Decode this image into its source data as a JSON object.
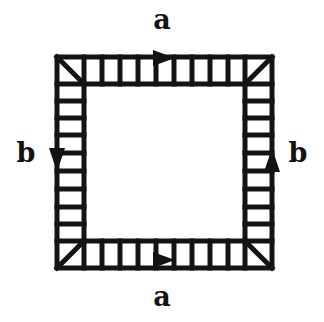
{
  "figure": {
    "ink_color": "#141414",
    "background_color": "#ffffff",
    "interior_color": "#ffffff",
    "geometry": {
      "outer_left": 57,
      "outer_top": 57,
      "outer_right": 272,
      "outer_bottom": 268,
      "band_thickness": 27,
      "stroke_width": 5,
      "cells_per_edge": 9,
      "corner_diagonals": 4
    },
    "edges": [
      {
        "id": "top",
        "label": "a",
        "arrow_direction": "right",
        "arrow_glyph": "▶",
        "arrow_count": 1,
        "label_position": "above"
      },
      {
        "id": "bottom",
        "label": "a",
        "arrow_direction": "right",
        "arrow_glyph": "▶",
        "arrow_count": 1,
        "label_position": "below"
      },
      {
        "id": "left",
        "label": "b",
        "arrow_direction": "down",
        "arrow_glyph": "▼",
        "arrow_count": 1,
        "label_position": "left"
      },
      {
        "id": "right",
        "label": "b",
        "arrow_direction": "up",
        "arrow_glyph": "▲",
        "arrow_count": 1,
        "label_position": "right"
      }
    ],
    "labels": {
      "a_top": "a",
      "a_bottom": "a",
      "b_left": "b",
      "b_right": "b"
    }
  }
}
